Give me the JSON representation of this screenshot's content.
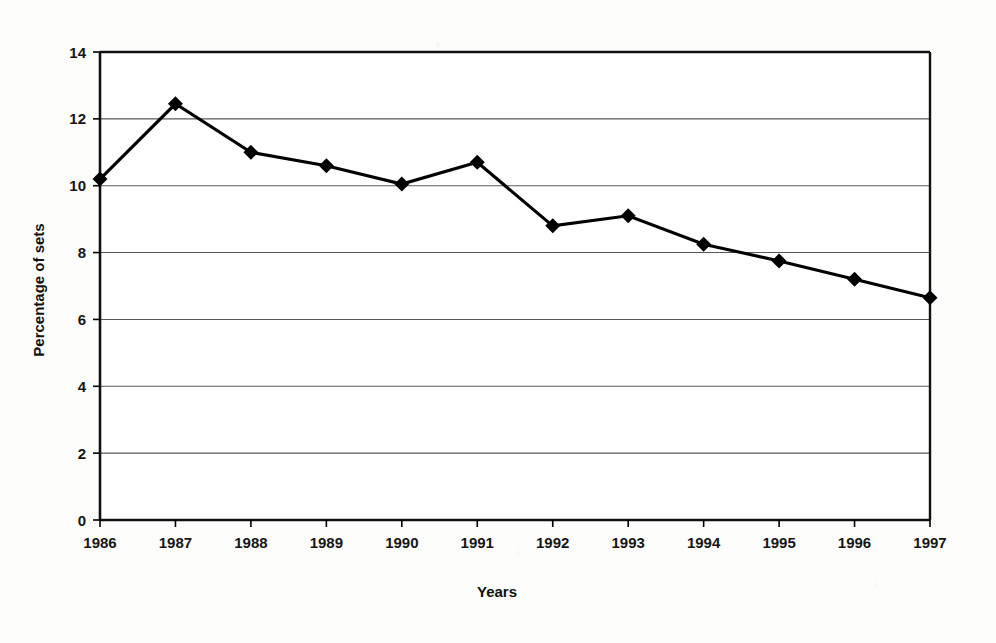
{
  "chart_data": {
    "type": "line",
    "title": "",
    "xlabel": "Years",
    "ylabel": "Percentage of sets",
    "categories": [
      "1986",
      "1987",
      "1988",
      "1989",
      "1990",
      "1991",
      "1992",
      "1993",
      "1994",
      "1995",
      "1996",
      "1997"
    ],
    "values": [
      10.2,
      12.45,
      11.0,
      10.6,
      10.05,
      10.7,
      8.8,
      9.1,
      8.25,
      7.75,
      7.2,
      6.65
    ],
    "series": [
      {
        "name": "Percentage of sets",
        "values": [
          10.2,
          12.45,
          11.0,
          10.6,
          10.05,
          10.7,
          8.8,
          9.1,
          8.25,
          7.75,
          7.2,
          6.65
        ]
      }
    ],
    "ylim": [
      0,
      14
    ],
    "yticks": [
      "0",
      "2",
      "4",
      "6",
      "8",
      "10",
      "12",
      "14"
    ],
    "ytick_step": 2,
    "xticks": [
      "1986",
      "1987",
      "1988",
      "1989",
      "1990",
      "1991",
      "1992",
      "1993",
      "1994",
      "1995",
      "1996",
      "1997"
    ],
    "grid": "horizontal",
    "legend": "none",
    "marker": "diamond",
    "line_color": "#000000",
    "marker_color": "#000000",
    "grid_color": "#5a5a5a",
    "axis_color": "#000000",
    "background_color": "#fdfdfc"
  }
}
